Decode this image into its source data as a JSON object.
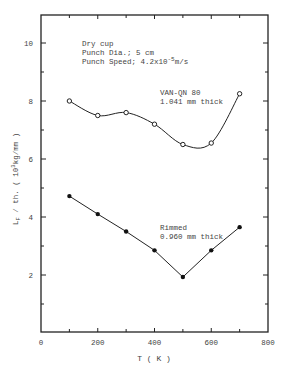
{
  "chart_data": {
    "type": "line",
    "title": "",
    "xlabel": "T ( K )",
    "ylabel": "L_F / th. ( 10^3 kg/mm )",
    "ylabel_parts": {
      "main": "L",
      "sub": "F",
      "rest": " / th. ( 10",
      "sup": "3",
      "unit": "kg/mm )"
    },
    "xlim": [
      0,
      800
    ],
    "ylim": [
      0,
      11
    ],
    "x_ticks": [
      "0",
      "200",
      "400",
      "600",
      "800"
    ],
    "y_ticks": [
      "2",
      "4",
      "6",
      "8",
      "10"
    ],
    "grid": false,
    "annotations": {
      "conditions": [
        "Dry cup",
        "Punch Dia.; 5 cm",
        "Punch Speed; 4.2x10"
      ],
      "speed_exp": "-5",
      "speed_unit": "m/s"
    },
    "series": [
      {
        "name": "VAN-QN 80 1.041 mm thick",
        "label_line1": "VAN-QN 80",
        "label_line2": "1.041 mm thick",
        "marker": "open-circle",
        "line": "smooth",
        "x": [
          100,
          200,
          300,
          400,
          500,
          600,
          700
        ],
        "values": [
          8.0,
          7.5,
          7.6,
          7.2,
          6.5,
          6.55,
          8.25
        ]
      },
      {
        "name": "Rimmed 0.960 mm thick",
        "label_line1": "Rimmed",
        "label_line2": "0.960 mm thick",
        "marker": "filled-circle",
        "line": "straight",
        "x": [
          100,
          200,
          300,
          400,
          500,
          600,
          700
        ],
        "values": [
          4.72,
          4.1,
          3.5,
          2.85,
          1.93,
          2.85,
          3.65
        ]
      }
    ]
  }
}
